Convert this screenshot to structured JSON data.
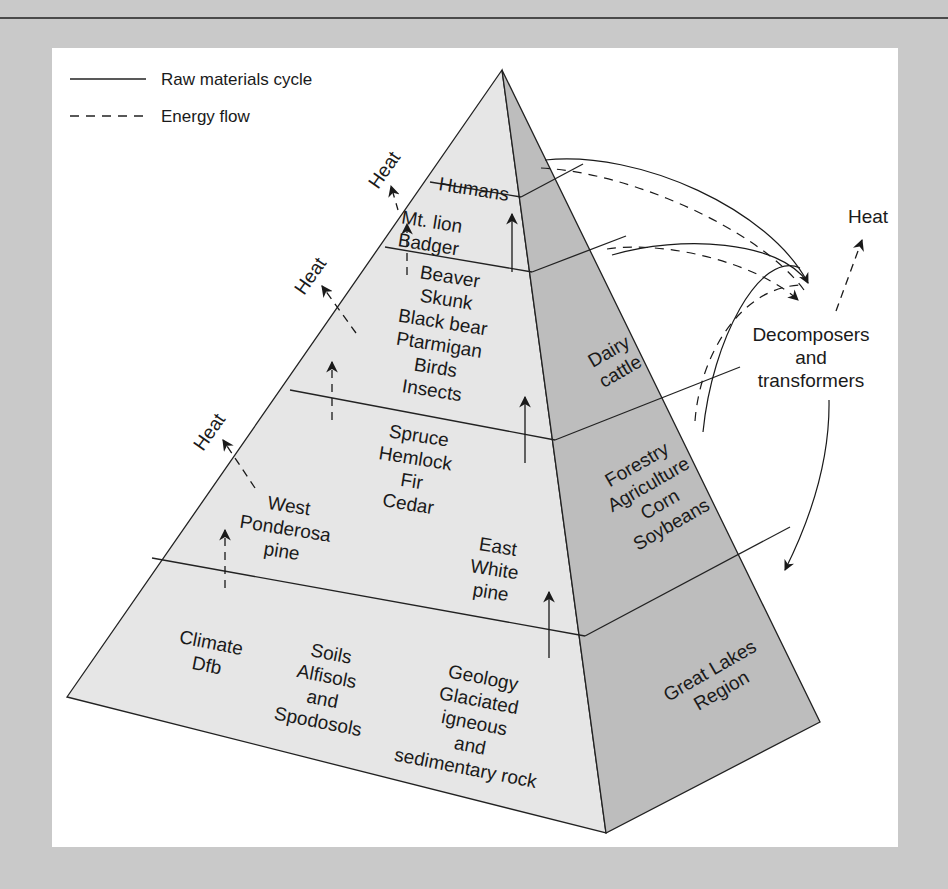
{
  "legend": {
    "raw_materials_label": "Raw materials cycle",
    "energy_flow_label": "Energy flow"
  },
  "pyramid": {
    "front_levels": [
      {
        "id": "top-consumers",
        "lines": [
          "Humans"
        ]
      },
      {
        "id": "carnivores",
        "lines": [
          "Mt. lion",
          "Badger"
        ]
      },
      {
        "id": "herbivores",
        "lines": [
          "Beaver",
          "Skunk",
          "Black bear",
          "Ptarmigan",
          "Birds",
          "Insects"
        ]
      },
      {
        "id": "producers",
        "center_lines": [
          "Spruce",
          "Hemlock",
          "Fir",
          "Cedar"
        ],
        "west_lines": [
          "West",
          "Ponderosa",
          "pine"
        ],
        "east_lines": [
          "East",
          "White",
          "pine"
        ]
      },
      {
        "id": "abiotic-base",
        "climate_lines": [
          "Climate",
          "Dfb"
        ],
        "soils_lines": [
          "Soils",
          "Alfisols",
          "and",
          "Spodosols"
        ],
        "geology_lines": [
          "Geology",
          "Glaciated",
          "igneous",
          "and",
          "sedimentary rock"
        ]
      }
    ],
    "side_levels": [
      {
        "id": "dairy",
        "lines": [
          "Dairy",
          "cattle"
        ]
      },
      {
        "id": "crops",
        "lines": [
          "Forestry",
          "Agriculture",
          "Corn",
          "Soybeans"
        ]
      },
      {
        "id": "region",
        "lines": [
          "Great Lakes",
          "Region"
        ]
      }
    ]
  },
  "heat_labels": [
    "Heat",
    "Heat",
    "Heat",
    "Heat"
  ],
  "decomposers": {
    "lines": [
      "Decomposers",
      "and",
      "transformers"
    ]
  },
  "colors": {
    "background": "#c9c9c9",
    "panel": "#ffffff",
    "front_face": "#e6e6e6",
    "side_face": "#bdbdbd",
    "line": "#222222"
  }
}
